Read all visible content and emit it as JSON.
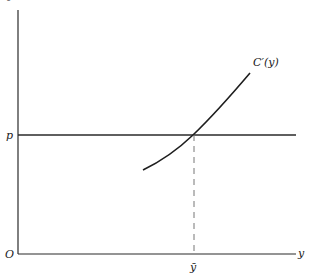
{
  "figure": {
    "title": "Figure 19.1",
    "axes": {
      "origin_label": "O",
      "x_label": "y",
      "y_tick_label": "p",
      "x_tick_label": "ȳ"
    },
    "curve": {
      "label": "C′(y)"
    },
    "colors": {
      "line": "#2a2a2a",
      "dashed": "#777777"
    }
  }
}
